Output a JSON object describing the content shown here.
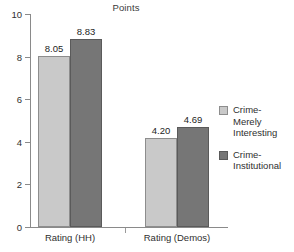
{
  "chart_data": {
    "type": "bar",
    "title": "Points",
    "xlabel": "",
    "ylabel": "",
    "ylim": [
      0,
      10
    ],
    "yticks": [
      0,
      2,
      4,
      6,
      8,
      10
    ],
    "ytick_labels": [
      "0",
      "2",
      "4",
      "6",
      "8",
      "10"
    ],
    "grid": false,
    "legend_position": "right",
    "categories": [
      "Rating (HH)",
      "Rating (Demos)"
    ],
    "series": [
      {
        "name": "Crime-\nMerely\nInteresting",
        "color": "#c9c9c9",
        "values": [
          8.05,
          4.2
        ],
        "value_labels": [
          "8.05",
          "4.20"
        ]
      },
      {
        "name": "Crime-\nInstitutional",
        "color": "#767676",
        "values": [
          8.83,
          4.69
        ],
        "value_labels": [
          "8.83",
          "4.69"
        ]
      }
    ]
  },
  "axis": {
    "tick_0": "0",
    "tick_2": "2",
    "tick_4": "4",
    "tick_6": "6",
    "tick_8": "8",
    "tick_10": "10"
  },
  "labels": {
    "group_1": "Rating (HH)",
    "group_2": "Rating (Demos)",
    "value_g1_light": "8.05",
    "value_g1_dark": "8.83",
    "value_g2_light": "4.20",
    "value_g2_dark": "4.69"
  },
  "legend": {
    "entry_1": "Crime-\nMerely\nInteresting",
    "entry_2": "Crime-\nInstitutional"
  },
  "colors": {
    "series_light": "#c9c9c9",
    "series_dark": "#767676",
    "axis": "#8a8a8a",
    "text": "#2f2f2f",
    "background": "#ffffff"
  }
}
